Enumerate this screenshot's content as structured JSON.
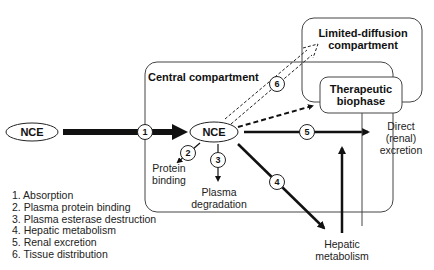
{
  "diagram": {
    "compartments": {
      "central": "Central compartment",
      "limited_diffusion": [
        "Limited-diffusion",
        "compartment"
      ],
      "therapeutic": [
        "Therapeutic",
        "biophase"
      ]
    },
    "nodes": {
      "nce_outside": "NCE",
      "nce_central": "NCE"
    },
    "step_numbers": [
      "1",
      "2",
      "3",
      "4",
      "5",
      "6"
    ],
    "outcomes": {
      "protein_binding": [
        "Protein",
        "binding"
      ],
      "plasma_degradation": [
        "Plasma",
        "degradation"
      ],
      "renal_excretion": [
        "Direct",
        "(renal)",
        "excretion"
      ],
      "hepatic_metabolism": [
        "Hepatic",
        "metabolism"
      ]
    },
    "legend": [
      "1. Absorption",
      "2. Plasma protein binding",
      "3. Plasma esterase destruction",
      "4. Hepatic metabolism",
      "5. Renal excretion",
      "6. Tissue distribution"
    ]
  }
}
